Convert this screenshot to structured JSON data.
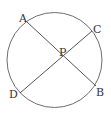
{
  "diagram": {
    "circle": {
      "cx": 54.5,
      "cy": 60,
      "r": 47.5,
      "stroke": "#6e6e6e"
    },
    "points": {
      "A": {
        "label": "A",
        "x": 27,
        "y": 22,
        "label_x": 19,
        "label_y": 22
      },
      "B": {
        "label": "B",
        "x": 96,
        "y": 86,
        "label_x": 96,
        "label_y": 96
      },
      "C": {
        "label": "C",
        "x": 92,
        "y": 31,
        "label_x": 93,
        "label_y": 33
      },
      "D": {
        "label": "D",
        "x": 20,
        "y": 93,
        "label_x": 9,
        "label_y": 98
      },
      "P": {
        "label": "P",
        "x": 62,
        "y": 57,
        "label_x": 59,
        "label_y": 56
      }
    },
    "segments": [
      {
        "name": "chord-AB",
        "from": "A",
        "to": "B"
      },
      {
        "name": "chord-CD",
        "from": "C",
        "to": "D"
      }
    ],
    "line_color": "#555555"
  }
}
